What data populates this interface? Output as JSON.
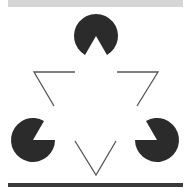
{
  "figure": {
    "colors": {
      "pacman": "#2b2b2b",
      "line": "#555555",
      "top_bar": "#d6d6d6",
      "bottom_bar": "#3a3a3a",
      "background": "#ffffff"
    },
    "pacmen": [
      {
        "name": "top",
        "cx": 96,
        "cy": 36,
        "r": 22,
        "mouth_dir_deg": 90
      },
      {
        "name": "left",
        "cx": 33,
        "cy": 140,
        "r": 22,
        "mouth_dir_deg": -30
      },
      {
        "name": "right",
        "cx": 157,
        "cy": 140,
        "r": 22,
        "mouth_dir_deg": 210
      }
    ],
    "mouth_angle_deg": 60,
    "corners": [
      {
        "name": "left",
        "points": "75,72 34,72 54,106"
      },
      {
        "name": "right",
        "points": "117,72 158,72 137,106"
      },
      {
        "name": "bottom",
        "points": "75,141 96,175 116,141"
      }
    ]
  }
}
